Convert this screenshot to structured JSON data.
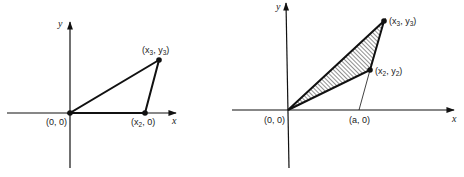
{
  "left_diagram": {
    "description": "Triangle with vertices at origin, a point on the x-axis, and a point in the first quadrant",
    "axis_labels": {
      "x": "x",
      "y": "y"
    },
    "points": {
      "origin": {
        "label": "(0, 0)"
      },
      "p2": {
        "label_pre": "(x",
        "sub": "2",
        "label_post": ", 0)"
      },
      "p3": {
        "label_pre": "(x",
        "sub1": "3",
        "mid": ", y",
        "sub2": "3",
        "label_post": ")"
      }
    },
    "colors": {
      "stroke": "#111111"
    }
  },
  "right_diagram": {
    "description": "Hatched triangle with vertices at origin, (x2, y2), (x3, y3); dashed line from (x2, y2) to (a, 0)",
    "axis_labels": {
      "x": "x",
      "y": "y"
    },
    "points": {
      "origin": {
        "label": "(0, 0)"
      },
      "a": {
        "label": "(a, 0)"
      },
      "p2": {
        "label_pre": "(x",
        "sub1": "2",
        "mid": ", y",
        "sub2": "2",
        "label_post": ")"
      },
      "p3": {
        "label_pre": "(x",
        "sub1": "3",
        "mid": ", y",
        "sub2": "3",
        "label_post": ")"
      }
    },
    "fill_pattern": "diagonal-hatching",
    "colors": {
      "stroke": "#111111",
      "hatch": "#333333"
    }
  }
}
